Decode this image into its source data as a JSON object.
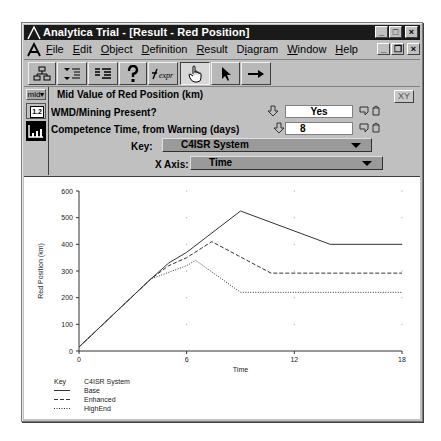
{
  "window": {
    "title": "Analytica Trial - [Result - Red Position]",
    "controls": {
      "minimize": "_",
      "maximize": "□",
      "close": "×"
    },
    "mdi_controls": {
      "minimize": "_",
      "restore": "❐",
      "close": "×"
    }
  },
  "menubar": {
    "items": [
      {
        "label": "File",
        "accel": "F"
      },
      {
        "label": "Edit",
        "accel": "E"
      },
      {
        "label": "Object",
        "accel": "O"
      },
      {
        "label": "Definition",
        "accel": "D"
      },
      {
        "label": "Result",
        "accel": "R"
      },
      {
        "label": "Diagram",
        "accel": "i"
      },
      {
        "label": "Window",
        "accel": "W"
      },
      {
        "label": "Help",
        "accel": "H"
      }
    ]
  },
  "toolbar": {
    "buttons": [
      {
        "icon": "diagram-icon",
        "pressed": false
      },
      {
        "icon": "outline-down-icon",
        "pressed": false
      },
      {
        "icon": "outline-list-icon",
        "pressed": false
      },
      {
        "icon": "help-question-icon",
        "pressed": false
      },
      {
        "icon": "expression-icon",
        "label": "expr",
        "pressed": false
      },
      {
        "icon": "hand-browse-icon",
        "pressed": true
      },
      {
        "icon": "arrow-pointer-icon",
        "pressed": false
      },
      {
        "icon": "arrow-connect-icon",
        "pressed": false
      }
    ]
  },
  "sidebar": {
    "uncertainty_view": "mid▾",
    "table_button": "1.2",
    "graph_button": "graph"
  },
  "panel": {
    "result_title": "Mid Value of Red Position (km)",
    "xy_button": "XY",
    "inputs": [
      {
        "label": "WMD/Mining Present?",
        "value": "Yes"
      },
      {
        "label": "Competence Time, from Warning  (days)",
        "value": "8"
      }
    ],
    "key_label": "Key:",
    "key_value": "C4ISR System",
    "xaxis_label": "X Axis:",
    "xaxis_value": "Time"
  },
  "chart_data": {
    "type": "line",
    "title": "",
    "xlabel": "Time",
    "ylabel": "Red Position (km)",
    "xlim": [
      0,
      18
    ],
    "ylim": [
      0,
      600
    ],
    "xticks": [
      0,
      6,
      12,
      18
    ],
    "yticks": [
      0,
      100,
      200,
      300,
      400,
      500,
      600
    ],
    "grid": "dots",
    "legend": {
      "position": "bottom-left",
      "header_key": "Key",
      "header_title": "C4ISR System",
      "entries": [
        {
          "name": "Base",
          "style": "solid"
        },
        {
          "name": "Enhanced",
          "style": "dashed"
        },
        {
          "name": "HighEnd",
          "style": "dotted"
        }
      ]
    },
    "series": [
      {
        "name": "Base",
        "style": "solid",
        "x": [
          0,
          4,
          5,
          6,
          9,
          14,
          18
        ],
        "y": [
          15,
          270,
          330,
          370,
          525,
          400,
          400
        ]
      },
      {
        "name": "Enhanced",
        "style": "dashed",
        "x": [
          0,
          4,
          5,
          6,
          7.4,
          10.7,
          18
        ],
        "y": [
          15,
          270,
          320,
          350,
          410,
          292,
          292
        ]
      },
      {
        "name": "HighEnd",
        "style": "dotted",
        "x": [
          0,
          4,
          5,
          6,
          6.5,
          9,
          18
        ],
        "y": [
          15,
          270,
          295,
          320,
          340,
          220,
          220
        ]
      }
    ]
  }
}
